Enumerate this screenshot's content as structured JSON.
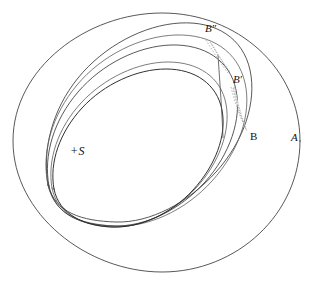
{
  "figure": {
    "type": "orbital-perturbation-diagram",
    "title": "",
    "background_color": "#ffffff",
    "line_color": "#3a3a3a",
    "width": 310,
    "height": 286
  },
  "central_body": {
    "name": "central-star",
    "label": "+S",
    "symbol": "+",
    "letter": "S",
    "x": 78,
    "y": 151
  },
  "labels": [
    {
      "id": "A",
      "text": "A",
      "x": 293,
      "y": 138,
      "italic": true,
      "description": "outer orbit apse label"
    },
    {
      "id": "B",
      "text": "B",
      "x": 252,
      "y": 137,
      "italic": false,
      "description": "body position on first orbit"
    },
    {
      "id": "Bprime",
      "text": "B′",
      "x": 235,
      "y": 80,
      "italic": true,
      "description": "body position on second orbit"
    },
    {
      "id": "Bdprime",
      "text": "B″",
      "x": 207,
      "y": 29,
      "italic": true,
      "description": "body position on third orbit"
    }
  ],
  "curves": [
    {
      "id": "outer-circle",
      "name": "orbit-outer-A",
      "weight": "normal",
      "description": "large outer circular orbit passing through A"
    },
    {
      "id": "ellipse-outer",
      "name": "orbit-ellipse-outer",
      "weight": "normal",
      "description": "outermost tilted ellipse through B″"
    },
    {
      "id": "ellipse-mid",
      "name": "orbit-ellipse-mid",
      "weight": "normal",
      "description": "middle tilted ellipse through B′"
    },
    {
      "id": "ellipse-mid2",
      "name": "orbit-ellipse-mid2",
      "weight": "faint",
      "description": "second middle tilted ellipse"
    },
    {
      "id": "ellipse-inner",
      "name": "orbit-ellipse-inner",
      "weight": "dark",
      "description": "innermost tilted ellipse through B"
    },
    {
      "id": "ellipse-inner2",
      "name": "orbit-ellipse-inner2",
      "weight": "faint",
      "description": "companion to inner ellipse"
    }
  ],
  "motion_markers": [
    {
      "id": "sliver-upper",
      "name": "displacement-sliver-upper",
      "from": "B″",
      "to": "B′",
      "style": "dotted"
    },
    {
      "id": "sliver-lower",
      "name": "displacement-sliver-lower",
      "from": "B′",
      "to": "B",
      "style": "dotted"
    }
  ],
  "convergence_point": {
    "x": 48,
    "y": 185,
    "description": "common perihelion node where all ellipses cross"
  }
}
